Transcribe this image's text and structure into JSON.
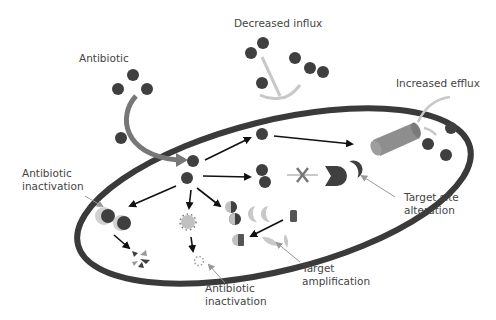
{
  "colors": {
    "membrane": "#3a3a3a",
    "molecule": "#3f3f3f",
    "light_gray": "#b8b8b8",
    "pump": "#8e8e8e",
    "arrow": "#111111",
    "text": "#444444"
  },
  "labels": {
    "antibiotic": "Antibiotic",
    "decreased_influx": "Decreased influx",
    "increased_efflux": "Increased efflux",
    "antibiotic_inactivation_left": "Antibiotic\ninactivation",
    "target_site_alteration": "Target site\nalteration",
    "target_amplification": "Target\namplification",
    "antibiotic_inactivation_bottom": "Antibiotic\ninactivation"
  }
}
